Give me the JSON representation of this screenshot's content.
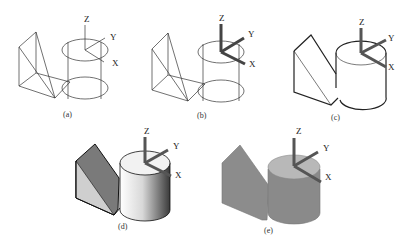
{
  "figure": {
    "panels": [
      {
        "id": "a",
        "caption": "(a)",
        "mode": "wireframe",
        "axes": [
          "Z",
          "Y",
          "X"
        ],
        "axis_style": "thin"
      },
      {
        "id": "b",
        "caption": "(b)",
        "mode": "wireframe",
        "axes": [
          "Z",
          "Y",
          "X"
        ],
        "axis_style": "3d"
      },
      {
        "id": "c",
        "caption": "(c)",
        "mode": "hidden-line",
        "axes": [
          "Z",
          "Y",
          "X"
        ],
        "axis_style": "3d"
      },
      {
        "id": "d",
        "caption": "(d)",
        "mode": "shaded-gradient",
        "axes": [
          "Z",
          "Y",
          "X"
        ],
        "axis_style": "3d"
      },
      {
        "id": "e",
        "caption": "(e)",
        "mode": "flat-shaded",
        "axes": [
          "Z",
          "Y",
          "X"
        ],
        "axis_style": "3d"
      }
    ],
    "colors": {
      "line": "#333333",
      "axis_bar": "#555555",
      "wedge_dark": "#7a7a7a",
      "wedge_light": "#c8c8c8",
      "cyl_top": "#eeeeee",
      "flat_gray": "#8c8c8c",
      "flat_top": "#b4b4b4"
    }
  }
}
